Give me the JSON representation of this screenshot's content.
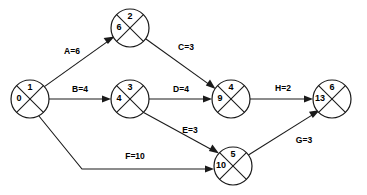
{
  "diagram": {
    "type": "activity-on-arrow-network",
    "background_color": "#ffffff",
    "line_color": "#1a1a1a",
    "nodes": [
      {
        "id": "n1",
        "event_number": "1",
        "earliest_time": "0",
        "cx": 30,
        "cy": 99,
        "r": 19
      },
      {
        "id": "n2",
        "event_number": "2",
        "earliest_time": "6",
        "cx": 130,
        "cy": 28,
        "r": 19
      },
      {
        "id": "n3",
        "event_number": "3",
        "earliest_time": "4",
        "cx": 130,
        "cy": 99,
        "r": 19
      },
      {
        "id": "n4",
        "event_number": "4",
        "earliest_time": "9",
        "cx": 231,
        "cy": 99,
        "r": 19
      },
      {
        "id": "n5",
        "event_number": "5",
        "earliest_time": "10",
        "cx": 233,
        "cy": 166,
        "r": 19
      },
      {
        "id": "n6",
        "event_number": "6",
        "earliest_time": "13",
        "cx": 332,
        "cy": 99,
        "r": 19
      }
    ],
    "edges": [
      {
        "id": "eA",
        "label": "A=6",
        "activity": "A",
        "duration": "6",
        "from": "n1",
        "to": "n2",
        "label_x": 72,
        "label_y": 52
      },
      {
        "id": "eB",
        "label": "B=4",
        "activity": "B",
        "duration": "4",
        "from": "n1",
        "to": "n3",
        "label_x": 80,
        "label_y": 90
      },
      {
        "id": "eC",
        "label": "C=3",
        "activity": "C",
        "duration": "3",
        "from": "n2",
        "to": "n4",
        "label_x": 186,
        "label_y": 48
      },
      {
        "id": "eD",
        "label": "D=4",
        "activity": "D",
        "duration": "4",
        "from": "n3",
        "to": "n4",
        "label_x": 181,
        "label_y": 90
      },
      {
        "id": "eE",
        "label": "E=3",
        "activity": "E",
        "duration": "3",
        "from": "n3",
        "to": "n5",
        "label_x": 190,
        "label_y": 131
      },
      {
        "id": "eF",
        "label": "F=10",
        "activity": "F",
        "duration": "10",
        "from": "n1",
        "to": "n5",
        "label_x": 135,
        "label_y": 157
      },
      {
        "id": "eG",
        "label": "G=3",
        "activity": "G",
        "duration": "3",
        "from": "n5",
        "to": "n6",
        "label_x": 304,
        "label_y": 141
      },
      {
        "id": "eH",
        "label": "H=2",
        "activity": "H",
        "duration": "2",
        "from": "n4",
        "to": "n6",
        "label_x": 283,
        "label_y": 89
      }
    ]
  }
}
